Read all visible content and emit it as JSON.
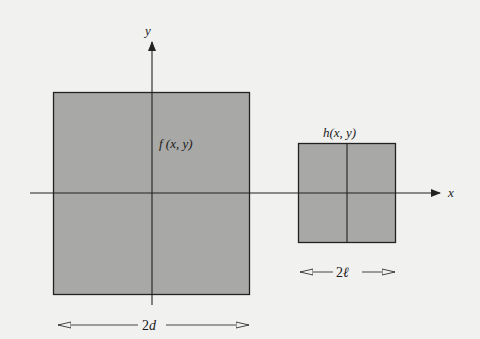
{
  "diagram": {
    "colors": {
      "background": "#f1f1f0",
      "fill": "#a8a8a6",
      "stroke": "#222222"
    },
    "axes": {
      "x_label": "x",
      "y_label": "y"
    },
    "regions": [
      {
        "id": "f",
        "label": "f (x, y)",
        "dimension_label": "2d",
        "dimension_num": "2",
        "dimension_var": "d"
      },
      {
        "id": "h",
        "label": "h(x, y)",
        "dimension_label": "2ℓ",
        "dimension_num": "2",
        "dimension_var": "ℓ"
      }
    ]
  }
}
